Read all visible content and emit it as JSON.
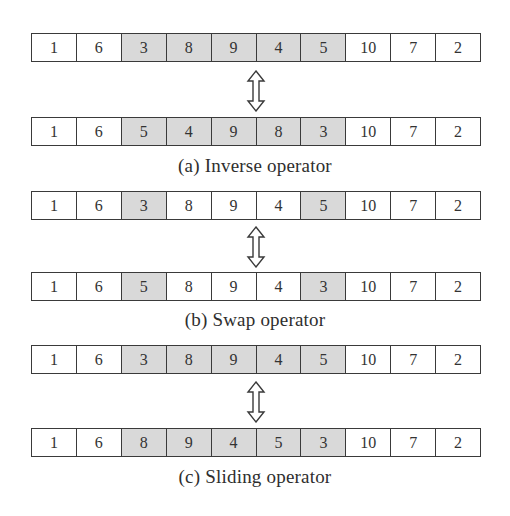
{
  "figure": {
    "highlight_color": "#d9d9d9",
    "panels": [
      {
        "id": "a",
        "caption": "(a) Inverse operator",
        "before": {
          "values": [
            "1",
            "6",
            "3",
            "8",
            "9",
            "4",
            "5",
            "10",
            "7",
            "2"
          ],
          "highlighted": [
            2,
            3,
            4,
            5,
            6
          ]
        },
        "after": {
          "values": [
            "1",
            "6",
            "5",
            "4",
            "9",
            "8",
            "3",
            "10",
            "7",
            "2"
          ],
          "highlighted": [
            2,
            3,
            4,
            5,
            6
          ]
        }
      },
      {
        "id": "b",
        "caption": "(b) Swap operator",
        "before": {
          "values": [
            "1",
            "6",
            "3",
            "8",
            "9",
            "4",
            "5",
            "10",
            "7",
            "2"
          ],
          "highlighted": [
            2,
            6
          ]
        },
        "after": {
          "values": [
            "1",
            "6",
            "5",
            "8",
            "9",
            "4",
            "3",
            "10",
            "7",
            "2"
          ],
          "highlighted": [
            2,
            6
          ]
        }
      },
      {
        "id": "c",
        "caption": "(c) Sliding operator",
        "before": {
          "values": [
            "1",
            "6",
            "3",
            "8",
            "9",
            "4",
            "5",
            "10",
            "7",
            "2"
          ],
          "highlighted": [
            2,
            3,
            4,
            5,
            6
          ]
        },
        "after": {
          "values": [
            "1",
            "6",
            "8",
            "9",
            "4",
            "5",
            "3",
            "10",
            "7",
            "2"
          ],
          "highlighted": [
            2,
            3,
            4,
            5,
            6
          ]
        }
      }
    ],
    "arrow_icon": "double-vertical-arrow-icon"
  }
}
